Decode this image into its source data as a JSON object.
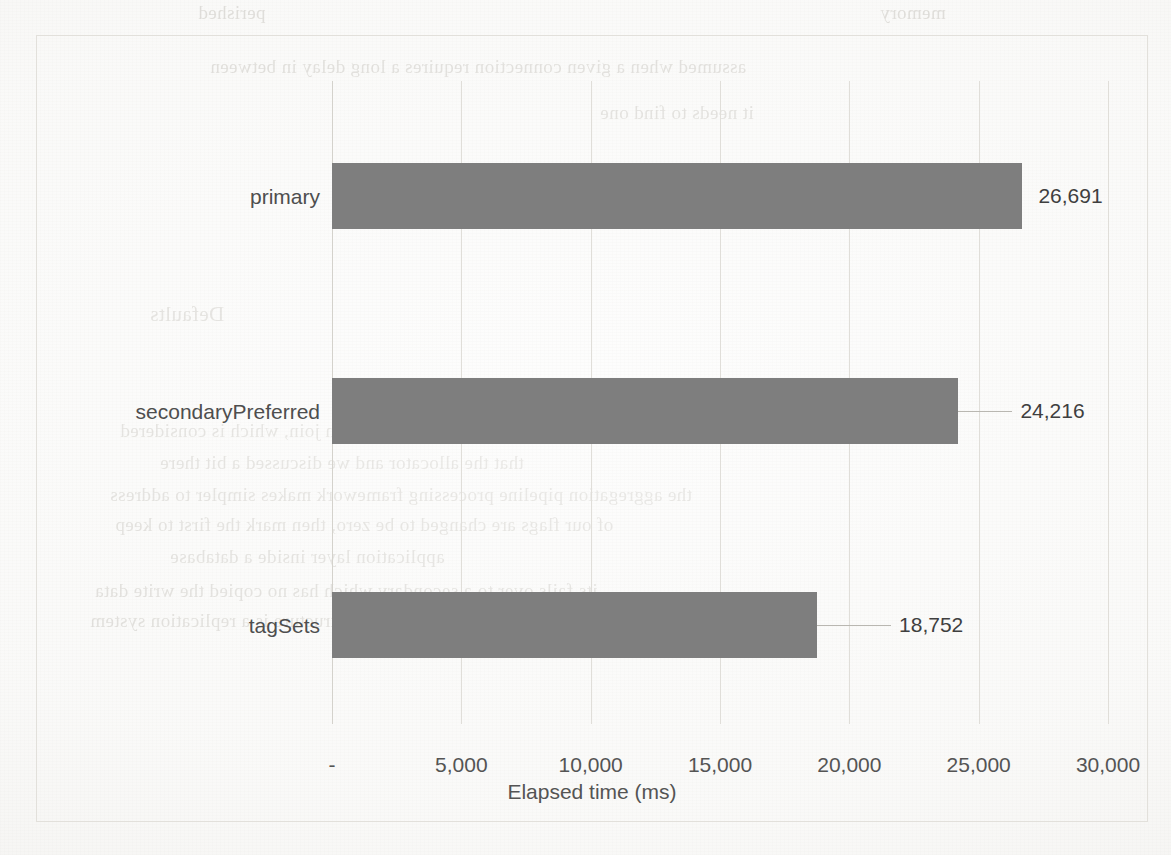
{
  "chart_data": {
    "type": "bar",
    "orientation": "horizontal",
    "title": "",
    "subtitle": "",
    "xlabel": "Elapsed time (ms)",
    "ylabel": "",
    "categories": [
      "primary",
      "secondaryPreferred",
      "tagSets"
    ],
    "values": [
      26691,
      24216,
      18752
    ],
    "data_labels": [
      "26,691",
      "24,216",
      "18,752"
    ],
    "xlim": [
      0,
      30000
    ],
    "xticks": [
      0,
      5000,
      10000,
      15000,
      20000,
      25000,
      30000
    ],
    "xtick_labels": [
      "-",
      "5,000",
      "10,000",
      "15,000",
      "20,000",
      "25,000",
      "30,000"
    ],
    "grid": true,
    "grid_axis": "x",
    "legend": false,
    "legend_position": "none",
    "series": [
      {
        "name": "Elapsed time (ms)",
        "values": [
          26691,
          24216,
          18752
        ],
        "color": "#7e7e7e"
      }
    ]
  },
  "colors": {
    "bar_fill": "#7e7e7e",
    "gridline": "#e0ded9",
    "axis_line": "#d4d2cc",
    "frame_border": "#e2e0db",
    "label_text": "#4e4e4e",
    "tick_text": "#545454",
    "page_background": "#fbfbfa",
    "bleed_text": "#b9b6ae"
  },
  "bleed_through_text": [
    {
      "text": "perished",
      "x": 198,
      "y": 2,
      "size": 19
    },
    {
      "text": "memory",
      "x": 880,
      "y": 2,
      "size": 19
    },
    {
      "text": "assumed when a given connection requires a long delay in between",
      "x": 210,
      "y": 56,
      "size": 19
    },
    {
      "text": "it needs to find one",
      "x": 600,
      "y": 102,
      "size": 19
    },
    {
      "text": "ms before returning to the",
      "x": 590,
      "y": 195,
      "size": 19
    },
    {
      "text": "Defaults",
      "x": 150,
      "y": 302,
      "size": 21
    },
    {
      "text": "There is never a cross-collection join, which is considered",
      "x": 120,
      "y": 420,
      "size": 19
    },
    {
      "text": "that the allocator and we discussed a bit there",
      "x": 160,
      "y": 452,
      "size": 19
    },
    {
      "text": "the aggregation pipeline processing framework makes simpler to address",
      "x": 110,
      "y": 484,
      "size": 19
    },
    {
      "text": "of our flags are changed to be zero, then mark the first to keep",
      "x": 115,
      "y": 514,
      "size": 19
    },
    {
      "text": "application layer inside a database",
      "x": 170,
      "y": 546,
      "size": 19
    },
    {
      "text": "its fails over to a secondary which has no copied the write data",
      "x": 95,
      "y": 580,
      "size": 19
    },
    {
      "text": "else is easier to use than a custom document structure is a replication system",
      "x": 90,
      "y": 610,
      "size": 19
    }
  ],
  "accessibility": {
    "chart_description": "Horizontal bar chart of elapsed time in milliseconds for three MongoDB read preference modes."
  }
}
